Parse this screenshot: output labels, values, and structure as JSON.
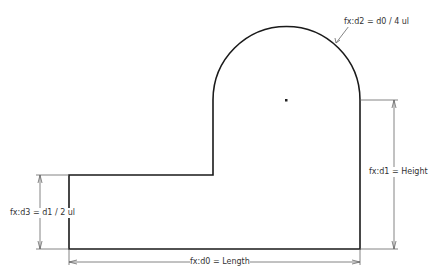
{
  "sketch": {
    "profile_color": "#1a1a1a",
    "dimension_color": "#555555"
  },
  "dimensions": {
    "d0": "fx:d0 = Length",
    "d1": "fx:d1 = Height",
    "d2": "fx:d2 = d0 / 4 ul",
    "d3": "fx:d3 = d1 / 2 ul"
  }
}
